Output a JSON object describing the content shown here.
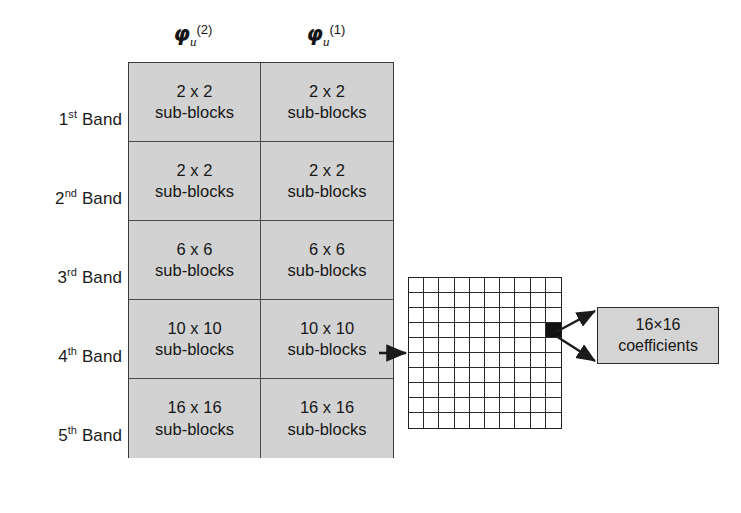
{
  "figure": {
    "columns": [
      {
        "id": "phi-u-2",
        "symbol": "φ",
        "subscript": "u",
        "superscript": "(2)"
      },
      {
        "id": "phi-u-1",
        "symbol": "φ",
        "subscript": "u",
        "superscript": "(1)"
      }
    ],
    "rows": [
      {
        "ordinal": "1",
        "ordinal_suffix": "st",
        "label_tail": " Band",
        "cells": [
          {
            "count": "2 x 2",
            "unit": "sub-blocks"
          },
          {
            "count": "2 x 2",
            "unit": "sub-blocks"
          }
        ]
      },
      {
        "ordinal": "2",
        "ordinal_suffix": "nd",
        "label_tail": " Band",
        "cells": [
          {
            "count": "2 x 2",
            "unit": "sub-blocks"
          },
          {
            "count": "2 x 2",
            "unit": "sub-blocks"
          }
        ]
      },
      {
        "ordinal": "3",
        "ordinal_suffix": "rd",
        "label_tail": " Band",
        "cells": [
          {
            "count": "6 x 6",
            "unit": "sub-blocks"
          },
          {
            "count": "6 x 6",
            "unit": "sub-blocks"
          }
        ]
      },
      {
        "ordinal": "4",
        "ordinal_suffix": "th",
        "label_tail": " Band",
        "cells": [
          {
            "count": "10 x 10",
            "unit": "sub-blocks"
          },
          {
            "count": "10 x 10",
            "unit": "sub-blocks"
          }
        ]
      },
      {
        "ordinal": "5",
        "ordinal_suffix": "th",
        "label_tail": " Band",
        "cells": [
          {
            "count": "16 x 16",
            "unit": "sub-blocks"
          },
          {
            "count": "16 x 16",
            "unit": "sub-blocks"
          }
        ]
      }
    ],
    "coefficient_grid": {
      "columns": 10,
      "rows": 10,
      "highlighted_cell": {
        "row": 4,
        "column": 10
      }
    },
    "callout": {
      "line1": "16×16",
      "line2": "coefficients"
    },
    "colors": {
      "cell_fill": "#d2d2d2",
      "callout_fill": "#d4d4d4",
      "stroke": "#2b2b2b",
      "highlight": "#111111",
      "background": "#ffffff"
    }
  }
}
